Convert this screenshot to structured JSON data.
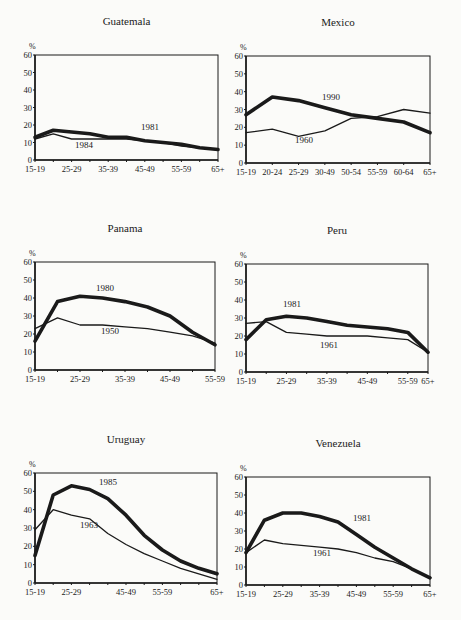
{
  "chart_data": [
    {
      "type": "line",
      "title": "Guatemala",
      "ylabel": "%",
      "ylim": [
        0,
        60
      ],
      "yticks": [
        0,
        10,
        20,
        30,
        40,
        50,
        60
      ],
      "x": [
        "15-19",
        "20-24",
        "25-29",
        "30-34",
        "35-39",
        "40-44",
        "45-49",
        "50-54",
        "55-59",
        "60-64",
        "65+"
      ],
      "xtick_labels": [
        "15-19",
        "25-29",
        "35-39",
        "45-49",
        "55-59",
        "65+"
      ],
      "series": [
        {
          "name": "1981",
          "weight": "thick",
          "values": [
            13,
            17,
            16,
            15,
            13,
            13,
            11,
            10,
            9,
            7,
            6
          ]
        },
        {
          "name": "1984",
          "weight": "thin",
          "values": [
            12,
            15,
            12,
            12,
            12,
            12,
            11,
            10,
            8,
            7,
            6
          ]
        }
      ],
      "annotations": [
        {
          "text": "1981",
          "series": "1981"
        },
        {
          "text": "1984",
          "series": "1984"
        }
      ]
    },
    {
      "type": "line",
      "title": "Mexico",
      "ylabel": "%",
      "ylim": [
        0,
        60
      ],
      "yticks": [
        0,
        10,
        20,
        30,
        40,
        50,
        60
      ],
      "x": [
        "15-19",
        "20-24",
        "25-29",
        "30-49",
        "50-54",
        "55-59",
        "60-64",
        "65+"
      ],
      "xtick_labels": [
        "15-19",
        "20-24",
        "25-29",
        "30-49",
        "50-54",
        "55-59",
        "60-64",
        "65+"
      ],
      "series": [
        {
          "name": "1990",
          "weight": "thick",
          "values": [
            27,
            37,
            35,
            31,
            27,
            25,
            23,
            17
          ]
        },
        {
          "name": "1960",
          "weight": "thin",
          "values": [
            17,
            19,
            15,
            18,
            25,
            26,
            30,
            28
          ]
        }
      ],
      "annotations": [
        {
          "text": "1990",
          "series": "1990"
        },
        {
          "text": "1960",
          "series": "1960"
        }
      ]
    },
    {
      "type": "line",
      "title": "Panama",
      "ylabel": "%",
      "ylim": [
        0,
        60
      ],
      "yticks": [
        0,
        10,
        20,
        30,
        40,
        50,
        60
      ],
      "x": [
        "15-19",
        "20-24",
        "25-29",
        "30-34",
        "35-39",
        "40-44",
        "45-49",
        "50-54",
        "55-59"
      ],
      "xtick_labels": [
        "15-19",
        "25-29",
        "35-39",
        "45-49",
        "55-59"
      ],
      "series": [
        {
          "name": "1980",
          "weight": "thick",
          "values": [
            16,
            38,
            41,
            40,
            38,
            35,
            30,
            21,
            14
          ]
        },
        {
          "name": "1950",
          "weight": "thin",
          "values": [
            23,
            29,
            25,
            25,
            24,
            23,
            21,
            19,
            15
          ]
        }
      ],
      "annotations": [
        {
          "text": "1980",
          "series": "1980"
        },
        {
          "text": "1950",
          "series": "1950"
        }
      ]
    },
    {
      "type": "line",
      "title": "Peru",
      "ylabel": "%",
      "ylim": [
        0,
        60
      ],
      "yticks": [
        0,
        10,
        20,
        30,
        40,
        50,
        60
      ],
      "x": [
        "15-19",
        "20-24",
        "25-29",
        "30-34",
        "35-39",
        "40-44",
        "45-49",
        "50-54",
        "55-59",
        "65+"
      ],
      "xtick_labels": [
        "15-19",
        "25-29",
        "35-39",
        "45-49",
        "55-59",
        "65+"
      ],
      "series": [
        {
          "name": "1981",
          "weight": "thick",
          "values": [
            18,
            29,
            31,
            30,
            28,
            26,
            25,
            24,
            22,
            11
          ]
        },
        {
          "name": "1961",
          "weight": "thin",
          "values": [
            27,
            28,
            22,
            21,
            20,
            20,
            20,
            19,
            18,
            11
          ]
        }
      ],
      "annotations": [
        {
          "text": "1981",
          "series": "1981"
        },
        {
          "text": "1961",
          "series": "1961"
        }
      ]
    },
    {
      "type": "line",
      "title": "Uruguay",
      "ylabel": "%",
      "ylim": [
        0,
        60
      ],
      "yticks": [
        0,
        10,
        20,
        30,
        40,
        50,
        60
      ],
      "x": [
        "15-19",
        "20-24",
        "25-29",
        "30-34",
        "35-39",
        "40-44",
        "45-49",
        "50-54",
        "55-59",
        "60-64",
        "65+"
      ],
      "xtick_labels": [
        "15-19",
        "25-29",
        "45-49",
        "55-59",
        "65+"
      ],
      "series": [
        {
          "name": "1985",
          "weight": "thick",
          "values": [
            15,
            48,
            53,
            51,
            46,
            37,
            26,
            18,
            12,
            8,
            5
          ]
        },
        {
          "name": "1963",
          "weight": "thin",
          "values": [
            29,
            40,
            37,
            35,
            27,
            21,
            16,
            12,
            8,
            5,
            2
          ]
        }
      ],
      "annotations": [
        {
          "text": "1985",
          "series": "1985"
        },
        {
          "text": "1963",
          "series": "1963"
        }
      ]
    },
    {
      "type": "line",
      "title": "Venezuela",
      "ylabel": "%",
      "ylim": [
        0,
        60
      ],
      "yticks": [
        0,
        10,
        20,
        30,
        40,
        50,
        60
      ],
      "x": [
        "15-19",
        "20-24",
        "25-29",
        "30-34",
        "35-39",
        "40-44",
        "45-49",
        "50-54",
        "55-59",
        "60-64",
        "65+"
      ],
      "xtick_labels": [
        "15-19",
        "25-29",
        "35-39",
        "45-49",
        "55-59",
        "65+"
      ],
      "series": [
        {
          "name": "1981",
          "weight": "thick",
          "values": [
            18,
            36,
            40,
            40,
            38,
            35,
            28,
            21,
            15,
            9,
            4
          ]
        },
        {
          "name": "1961",
          "weight": "thin",
          "values": [
            18,
            25,
            23,
            22,
            21,
            20,
            18,
            15,
            13,
            9,
            4
          ]
        }
      ],
      "annotations": [
        {
          "text": "1981",
          "series": "1981"
        },
        {
          "text": "1961",
          "series": "1961"
        }
      ]
    }
  ],
  "panels": [
    {
      "title": "Guatemala",
      "x0": 35,
      "x1": 218,
      "yTop": 55,
      "yBot": 160,
      "xtick_pos": [
        0,
        2,
        4,
        6,
        8,
        10
      ],
      "labels": [
        {
          "text": "1981",
          "x": 141,
          "y": 130
        },
        {
          "text": "1984",
          "x": 75,
          "y": 148
        }
      ]
    },
    {
      "title": "Mexico",
      "x0": 246,
      "x1": 430,
      "yTop": 56,
      "yBot": 163,
      "xtick_pos": [
        0,
        1,
        2,
        3,
        4,
        5,
        6,
        7
      ],
      "labels": [
        {
          "text": "1990",
          "x": 322,
          "y": 100
        },
        {
          "text": "1960",
          "x": 295,
          "y": 143
        }
      ]
    },
    {
      "title": "Panama",
      "x0": 35,
      "x1": 215,
      "yTop": 262,
      "yBot": 370,
      "xtick_pos": [
        0,
        2,
        4,
        6,
        8
      ],
      "labels": [
        {
          "text": "1980",
          "x": 96,
          "y": 291
        },
        {
          "text": "1950",
          "x": 101,
          "y": 334
        }
      ]
    },
    {
      "title": "Peru",
      "x0": 246,
      "x1": 428,
      "yTop": 264,
      "yBot": 372,
      "xtick_pos": [
        0,
        2,
        4,
        6,
        8,
        9
      ],
      "labels": [
        {
          "text": "1981",
          "x": 283,
          "y": 307
        },
        {
          "text": "1961",
          "x": 320,
          "y": 348
        }
      ]
    },
    {
      "title": "Uruguay",
      "x0": 35,
      "x1": 217,
      "yTop": 473,
      "yBot": 583,
      "xtick_pos": [
        0,
        2,
        5,
        7,
        10
      ],
      "labels": [
        {
          "text": "1985",
          "x": 99,
          "y": 485
        },
        {
          "text": "1963",
          "x": 80,
          "y": 528
        }
      ]
    },
    {
      "title": "Venezuela",
      "x0": 246,
      "x1": 430,
      "yTop": 477,
      "yBot": 585,
      "xtick_pos": [
        0,
        2,
        4,
        6,
        8,
        10
      ],
      "labels": [
        {
          "text": "1981",
          "x": 353,
          "y": 521
        },
        {
          "text": "1961",
          "x": 313,
          "y": 556
        }
      ]
    }
  ],
  "ink_color": "#1a1a1a",
  "paper_color": "#fbfbf9"
}
